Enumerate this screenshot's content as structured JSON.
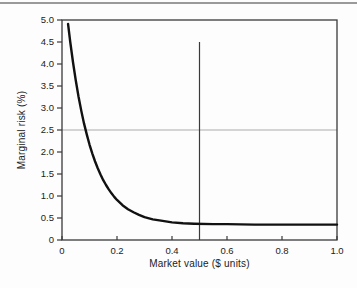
{
  "figure": {
    "background": "#fdfdfd",
    "top_rule_color": "#9a9a9a"
  },
  "chart_data": {
    "type": "line",
    "title": "",
    "xlabel": "Market value ($ units)",
    "ylabel": "Marginal risk (%)",
    "xlim": [
      0,
      1.0
    ],
    "ylim": [
      0,
      5.0
    ],
    "grid": false,
    "legend_position": "none",
    "axis_color": "#3a3a3a",
    "tick_label_color": "#222222",
    "x_ticks": [
      {
        "v": 0,
        "label": "0"
      },
      {
        "v": 0.2,
        "label": "0.2"
      },
      {
        "v": 0.4,
        "label": "0.4"
      },
      {
        "v": 0.6,
        "label": "0.6"
      },
      {
        "v": 0.8,
        "label": "0.8"
      },
      {
        "v": 1.0,
        "label": "1.0"
      }
    ],
    "y_ticks": [
      {
        "v": 5.0,
        "label": "5.0"
      },
      {
        "v": 4.5,
        "label": "4.5"
      },
      {
        "v": 4.0,
        "label": "4.0"
      },
      {
        "v": 3.5,
        "label": "3.5"
      },
      {
        "v": 3.0,
        "label": "3.0"
      },
      {
        "v": 2.5,
        "label": "2.5"
      },
      {
        "v": 2.0,
        "label": "2.0"
      },
      {
        "v": 1.5,
        "label": "1.5"
      },
      {
        "v": 1.0,
        "label": "1.0"
      },
      {
        "v": 0.5,
        "label": "0.5"
      },
      {
        "v": 0,
        "label": "0"
      }
    ],
    "series": [
      {
        "name": "marginal-risk-curve",
        "color": "#111111",
        "width": 2.4,
        "x": [
          0.022,
          0.03,
          0.04,
          0.05,
          0.06,
          0.07,
          0.08,
          0.09,
          0.1,
          0.11,
          0.12,
          0.13,
          0.14,
          0.15,
          0.16,
          0.17,
          0.18,
          0.19,
          0.2,
          0.22,
          0.24,
          0.26,
          0.28,
          0.3,
          0.33,
          0.36,
          0.4,
          0.44,
          0.48,
          0.55,
          0.6,
          0.7,
          0.8,
          0.9,
          1.0
        ],
        "y": [
          4.91,
          4.5,
          4.04,
          3.63,
          3.26,
          2.94,
          2.65,
          2.4,
          2.17,
          1.97,
          1.79,
          1.63,
          1.49,
          1.36,
          1.25,
          1.15,
          1.06,
          0.98,
          0.91,
          0.79,
          0.7,
          0.63,
          0.57,
          0.52,
          0.47,
          0.44,
          0.4,
          0.38,
          0.37,
          0.36,
          0.36,
          0.35,
          0.35,
          0.35,
          0.35
        ]
      }
    ],
    "reference_lines": [
      {
        "name": "horizontal-reference-2.5",
        "orientation": "horizontal",
        "value": 2.5,
        "from": 0,
        "to": 1.0,
        "color": "#ababab",
        "width": 1.2
      },
      {
        "name": "vertical-reference-0.5",
        "orientation": "vertical",
        "value": 0.5,
        "from": 0,
        "to": 4.5,
        "color": "#3a3a3a",
        "width": 1.2
      }
    ]
  }
}
